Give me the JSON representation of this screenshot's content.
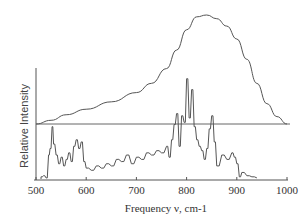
{
  "chart_data": {
    "type": "line",
    "title": "",
    "xlabel": "Frequency ν, cm-1",
    "ylabel": "Relative Intensity",
    "xlim": [
      500,
      1000
    ],
    "xticks": [
      500,
      600,
      700,
      800,
      900,
      1000
    ],
    "xtick_labels": [
      "500",
      "600",
      "700",
      "800",
      "900",
      "1000"
    ],
    "grid": false,
    "legend": null,
    "colors": {
      "line": "#555555",
      "axis": "#555555",
      "text": "#333333"
    },
    "series": [
      {
        "name": "broad envelope (upper)",
        "style": "smooth",
        "x": [
          500,
          530,
          560,
          600,
          650,
          700,
          730,
          760,
          780,
          800,
          820,
          840,
          860,
          880,
          900,
          920,
          940,
          960,
          980,
          1000
        ],
        "y": [
          0.42,
          0.44,
          0.47,
          0.5,
          0.54,
          0.59,
          0.64,
          0.72,
          0.82,
          0.93,
          1.0,
          1.01,
          0.99,
          0.95,
          0.88,
          0.77,
          0.64,
          0.53,
          0.46,
          0.42
        ]
      },
      {
        "name": "reference baseline",
        "style": "flat",
        "x": [
          500,
          1000
        ],
        "y": [
          0.45,
          0.45
        ]
      },
      {
        "name": "discrete spectrum (lower)",
        "style": "stick",
        "x": [
          510,
          515,
          520,
          525,
          528,
          532,
          535,
          540,
          545,
          550,
          555,
          560,
          565,
          570,
          575,
          580,
          585,
          590,
          595,
          600,
          610,
          620,
          630,
          640,
          650,
          660,
          670,
          680,
          690,
          700,
          710,
          720,
          730,
          740,
          750,
          760,
          765,
          770,
          775,
          780,
          785,
          790,
          795,
          800,
          805,
          810,
          815,
          820,
          825,
          830,
          835,
          840,
          845,
          850,
          855,
          860,
          870,
          880,
          890,
          895,
          900,
          905,
          910,
          920,
          930,
          940
        ],
        "y": [
          0.02,
          0.03,
          0.01,
          0.22,
          0.28,
          0.48,
          0.32,
          0.22,
          0.14,
          0.2,
          0.12,
          0.18,
          0.24,
          0.16,
          0.3,
          0.36,
          0.28,
          0.34,
          0.16,
          0.1,
          0.08,
          0.12,
          0.1,
          0.14,
          0.12,
          0.18,
          0.16,
          0.22,
          0.14,
          0.2,
          0.18,
          0.24,
          0.22,
          0.26,
          0.24,
          0.3,
          0.2,
          0.36,
          0.5,
          0.6,
          0.3,
          0.58,
          0.52,
          0.92,
          0.56,
          0.82,
          0.48,
          0.36,
          0.3,
          0.26,
          0.18,
          0.28,
          0.46,
          0.58,
          0.34,
          0.12,
          0.22,
          0.18,
          0.24,
          0.2,
          0.14,
          0.02,
          0.06,
          0.03,
          0.02,
          0.01
        ]
      }
    ]
  }
}
